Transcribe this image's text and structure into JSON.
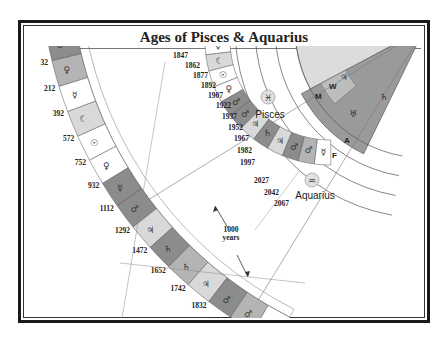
{
  "title": "Ages of Pisces & Aquarius",
  "colors": {
    "dark": "#8c8c8c",
    "mid": "#b4b4b4",
    "light": "#d9d9d9",
    "white": "#ffffff",
    "jupiter_sector": "#dcdcdc",
    "saturn_sector": "#9a9a9a"
  },
  "outer_band": {
    "labels": [
      "148BC",
      "32",
      "212",
      "392",
      "572",
      "752",
      "932",
      "1112",
      "1292",
      "1472",
      "1652",
      "1742",
      "1832",
      "2012",
      "2192"
    ],
    "symbols": [
      "♂",
      "♀",
      "☿",
      "☾",
      "☉",
      "♀",
      "☿",
      "♂",
      "♃",
      "♄",
      "♄",
      "♃",
      "♂",
      "♂",
      "☿"
    ]
  },
  "inner_band": {
    "labels": [
      "1847",
      "1862",
      "1877",
      "1892",
      "1907",
      "1922",
      "1937",
      "1952",
      "1967",
      "1982",
      "1997",
      "2027",
      "2042",
      "2067"
    ],
    "symbols": [
      "♂",
      "♂",
      "☿",
      "☾",
      "☉",
      "♀",
      "♂",
      "♂",
      "♃",
      "♄",
      "♃",
      "♂",
      "♂",
      "☿"
    ]
  },
  "signs": {
    "pisces": {
      "glyph": "♓",
      "label": "Pisces"
    },
    "aquarius": {
      "glyph": "♒",
      "label": "Aquarius"
    }
  },
  "annotation": {
    "line1": "1000",
    "line2": "years"
  },
  "wheel": {
    "ring_labels": [
      "M",
      "W",
      "A",
      "F"
    ],
    "jupiter": "♃",
    "saturn": "♄",
    "uranus": "♅"
  }
}
